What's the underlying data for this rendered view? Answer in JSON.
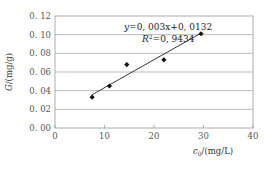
{
  "chart_data": {
    "type": "scatter",
    "title": "",
    "xlabel": "c0/(mg/L)",
    "xlabel_main": "c",
    "xlabel_sub": "0",
    "xlabel_rest": "/(mg/L)",
    "ylabel": "G/(mg/g)",
    "ylabel_main": "G",
    "ylabel_rest": "/(mg/g)",
    "xlim": [
      0,
      40
    ],
    "ylim": [
      0,
      0.12
    ],
    "x_ticks": [
      "0",
      "10",
      "20",
      "30",
      "40"
    ],
    "y_ticks": [
      "0.00",
      "0.02",
      "0.04",
      "0.06",
      "0.08",
      "0.10",
      "0.12"
    ],
    "y_ticks_display": [
      "0. 00",
      "0. 02",
      "0. 04",
      "0. 06",
      "0. 08",
      "0. 10",
      "0. 12"
    ],
    "grid": "horizontal",
    "series": [
      {
        "name": "data",
        "marker": "diamond",
        "points": [
          {
            "x": 7.5,
            "y": 0.033
          },
          {
            "x": 11.0,
            "y": 0.045
          },
          {
            "x": 14.5,
            "y": 0.068
          },
          {
            "x": 22.0,
            "y": 0.073
          },
          {
            "x": 29.5,
            "y": 0.101
          }
        ]
      }
    ],
    "trendline": {
      "type": "linear",
      "slope": 0.003,
      "intercept": 0.0132,
      "x_range": [
        7.5,
        29.5
      ],
      "equation": "y=0.003x+0.0132",
      "equation_display": "y=0, 003x+0, 0132",
      "r2_label": "R",
      "r2_value": "=0, 9434",
      "r2": 0.9434
    },
    "colors": {
      "grid": "#aaaaaa",
      "axis": "#999999",
      "marker": "#111111",
      "line": "#222222"
    }
  }
}
